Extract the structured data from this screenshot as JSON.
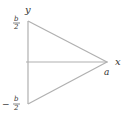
{
  "diagram": {
    "axis_labels": {
      "x": "x",
      "y": "y"
    },
    "points": {
      "apex_label": "a",
      "top_label": {
        "numerator": "b",
        "denominator": "2",
        "sign": ""
      },
      "bottom_label": {
        "numerator": "b",
        "denominator": "2",
        "sign": "−"
      }
    },
    "colors": {
      "line": "#b0b0b0",
      "text": "#333333"
    },
    "shape": "isosceles triangle with base on y-axis from -b/2 to b/2 and apex at (a, 0)"
  }
}
